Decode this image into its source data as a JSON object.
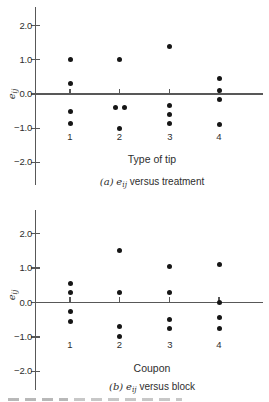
{
  "figure": {
    "plots": [
      {
        "id": "a",
        "ylabel_var": "e",
        "ylabel_sub": "ij",
        "xlabel": "Type of tip",
        "caption_label": "(a)",
        "caption_var": "e",
        "caption_sub": "ij",
        "caption_text": "versus treatment",
        "yticks": [
          "2.0",
          "1.0",
          "0.0",
          "−1.0",
          "−2.0"
        ],
        "xticks": [
          "1",
          "2",
          "3",
          "4"
        ]
      },
      {
        "id": "b",
        "ylabel_var": "e",
        "ylabel_sub": "ij",
        "xlabel": "Coupon",
        "caption_label": "(b)",
        "caption_var": "e",
        "caption_sub": "ij",
        "caption_text": "versus block",
        "yticks": [
          "2.0",
          "1.0",
          "0.0",
          "−1.0",
          "−2.0"
        ],
        "xticks": [
          "1",
          "2",
          "3",
          "4"
        ]
      }
    ],
    "accent_colors": {
      "axis": "#585858",
      "marker": "#161616",
      "text": "#2e2e2e",
      "background": "#ffffff"
    }
  },
  "chart_data": [
    {
      "type": "scatter",
      "title": "(a) e_ij versus treatment",
      "xlabel": "Type of tip",
      "ylabel": "e_ij",
      "x_categories": [
        1,
        2,
        3,
        4
      ],
      "ylim": [
        -2.5,
        2.5
      ],
      "ytick_values": [
        2.0,
        1.0,
        0.0,
        -1.0,
        -2.0
      ],
      "zero_line": true,
      "grid": false,
      "marker": "filled-circle",
      "points": [
        {
          "x": 1,
          "y": 1.0
        },
        {
          "x": 1,
          "y": 0.3
        },
        {
          "x": 1,
          "y": -0.5
        },
        {
          "x": 1,
          "y": -0.85
        },
        {
          "x": 2,
          "y": 1.0
        },
        {
          "x": 2,
          "y": -0.4
        },
        {
          "x": 2,
          "y": -0.4
        },
        {
          "x": 2,
          "y": -1.0
        },
        {
          "x": 3,
          "y": 1.4
        },
        {
          "x": 3,
          "y": -0.35
        },
        {
          "x": 3,
          "y": -0.6
        },
        {
          "x": 3,
          "y": -0.85
        },
        {
          "x": 4,
          "y": 0.45
        },
        {
          "x": 4,
          "y": 0.1
        },
        {
          "x": 4,
          "y": -0.15
        },
        {
          "x": 4,
          "y": -0.9
        }
      ]
    },
    {
      "type": "scatter",
      "title": "(b) e_ij versus block",
      "xlabel": "Coupon",
      "ylabel": "e_ij",
      "x_categories": [
        1,
        2,
        3,
        4
      ],
      "ylim": [
        -2.5,
        2.5
      ],
      "ytick_values": [
        2.0,
        1.0,
        0.0,
        -1.0,
        -2.0
      ],
      "zero_line": true,
      "grid": false,
      "marker": "filled-circle",
      "points": [
        {
          "x": 1,
          "y": 0.55
        },
        {
          "x": 1,
          "y": 0.3
        },
        {
          "x": 1,
          "y": -0.25
        },
        {
          "x": 1,
          "y": -0.55
        },
        {
          "x": 2,
          "y": 1.5
        },
        {
          "x": 2,
          "y": 0.3
        },
        {
          "x": 2,
          "y": -0.7
        },
        {
          "x": 2,
          "y": -1.0
        },
        {
          "x": 3,
          "y": 1.05
        },
        {
          "x": 3,
          "y": 0.3
        },
        {
          "x": 3,
          "y": -0.5
        },
        {
          "x": 3,
          "y": -0.75
        },
        {
          "x": 4,
          "y": 1.1
        },
        {
          "x": 4,
          "y": 0.0
        },
        {
          "x": 4,
          "y": -0.45
        },
        {
          "x": 4,
          "y": -0.75
        }
      ]
    }
  ]
}
